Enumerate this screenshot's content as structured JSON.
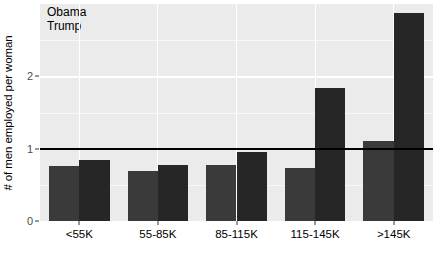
{
  "chart_data": {
    "type": "bar",
    "title": "",
    "xlabel": "",
    "ylabel": "# of men employed per woman",
    "categories": [
      "<55K",
      "55-85K",
      "85-115K",
      "115-145K",
      ">145K"
    ],
    "series": [
      {
        "name": "Obama",
        "color": "#3a3a3a",
        "values": [
          0.76,
          0.69,
          0.78,
          0.73,
          1.1
        ]
      },
      {
        "name": "Trump",
        "color": "#262626",
        "values": [
          0.84,
          0.78,
          0.95,
          1.84,
          2.87
        ]
      }
    ],
    "ylim": [
      0,
      3
    ],
    "y_ticks": [
      "0",
      "1",
      "2"
    ],
    "y_tick_values": [
      0,
      1,
      2
    ],
    "grid": true,
    "grid_color": "#ffffff",
    "panel_color": "#ebebeb",
    "legend_position": "top-left-inside",
    "reference_line": {
      "value": 1,
      "color": "#000000",
      "label": "parity"
    }
  },
  "legend": {
    "entries": [
      {
        "label": "Obama",
        "color": "#3a3a3a"
      },
      {
        "label": "Trump",
        "color": "#262626"
      }
    ]
  },
  "axes": {
    "y_title": "# of men employed per woman",
    "y_tick_labels": [
      "0",
      "1",
      "2"
    ],
    "x_tick_labels": [
      "<55K",
      "55-85K",
      "85-115K",
      "115-145K",
      ">145K"
    ]
  }
}
